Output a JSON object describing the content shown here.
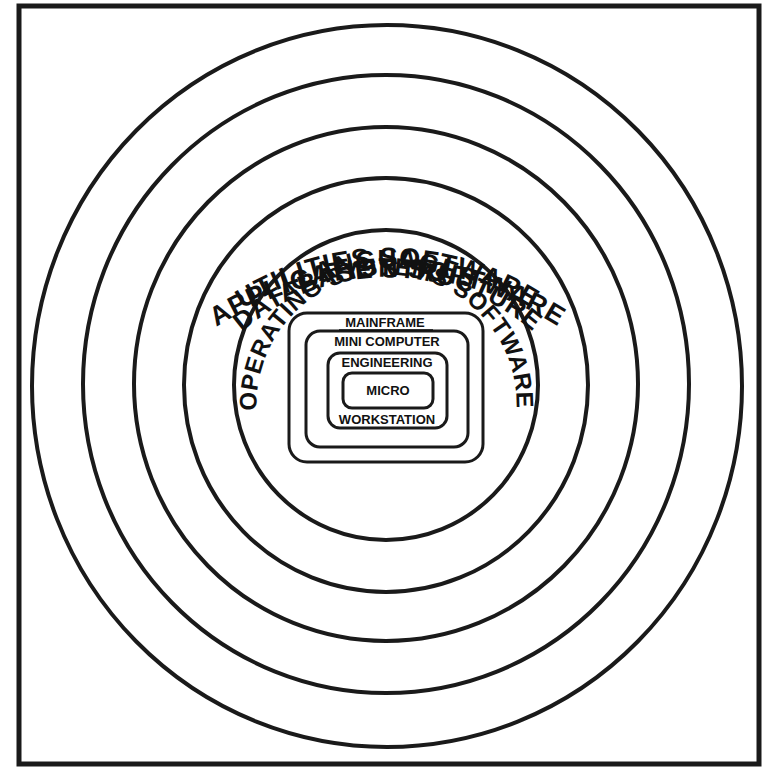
{
  "diagram": {
    "rings": [
      {
        "label": "APPLICATION SOFTWARE"
      },
      {
        "label": "UTILITIES SOFTWARE"
      },
      {
        "label": "DATABASE STRUCTURE"
      },
      {
        "label": "LANGUAGES"
      },
      {
        "label": "OPERATING SYSTEMS SOFTWARE"
      }
    ],
    "hardware": [
      {
        "label": "MAINFRAME"
      },
      {
        "label": "MINI COMPUTER"
      },
      {
        "label": "ENGINEERING"
      },
      {
        "label": "WORKSTATION"
      },
      {
        "label": "MICRO"
      }
    ],
    "colors": {
      "ink": "#111111",
      "background": "#ffffff"
    }
  }
}
